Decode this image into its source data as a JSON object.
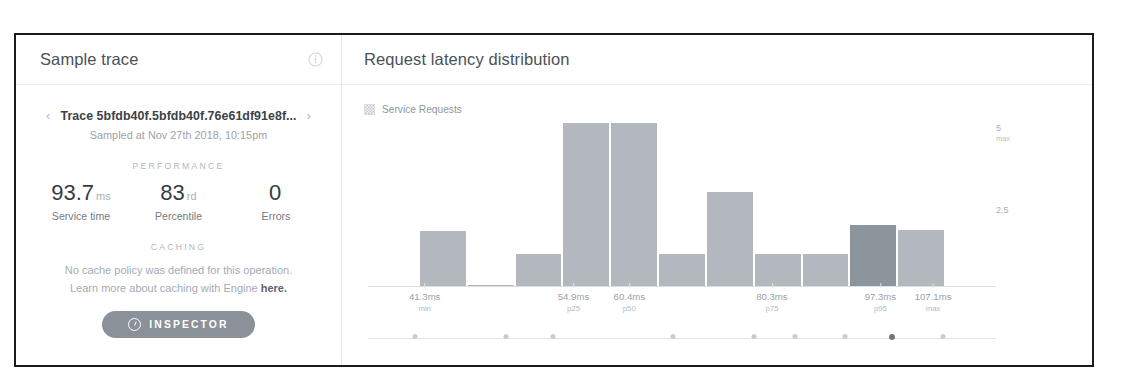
{
  "left_panel": {
    "title": "Sample trace",
    "info_icon": "info-circle-icon",
    "prev_icon": "chevron-left-icon",
    "next_icon": "chevron-right-icon",
    "trace_id": "Trace 5bfdb40f.5bfdb40f.76e61df91e8f...",
    "sampled_at": "Sampled at Nov 27th 2018, 10:15pm",
    "performance_heading": "PERFORMANCE",
    "metrics": [
      {
        "value": "93.7",
        "unit": "ms",
        "label": "Service time"
      },
      {
        "value": "83",
        "unit": "rd",
        "label": "Percentile"
      },
      {
        "value": "0",
        "unit": "",
        "label": "Errors"
      }
    ],
    "caching_heading": "CACHING",
    "caching_line1": "No cache policy was defined for this operation.",
    "caching_line2_prefix": "Learn more about caching with Engine ",
    "caching_link": "here.",
    "inspector_button": "INSPECTOR",
    "inspector_icon": "inspector-circle-icon"
  },
  "right_panel": {
    "title": "Request latency distribution",
    "legend": [
      {
        "label": "Service Requests",
        "swatch": "hatched-gray"
      }
    ]
  },
  "chart_data": {
    "type": "bar",
    "title": "Request latency distribution",
    "xlabel": "",
    "ylabel": "",
    "grid": false,
    "legend_position": "top-left",
    "series": [
      {
        "name": "Service Requests",
        "values": [
          0,
          1.7,
          0.06,
          1.0,
          5.0,
          5.0,
          1.0,
          2.9,
          1.0,
          1.0,
          1.9,
          1.75,
          0
        ]
      }
    ],
    "highlighted_bar_index": 10,
    "ylim": [
      0,
      5
    ],
    "yticks": [
      {
        "value": 5,
        "label": "5",
        "sublabel": "max"
      },
      {
        "value": 2.5,
        "label": "2.5",
        "sublabel": ""
      }
    ],
    "xticks": [
      {
        "position_pct": 8.5,
        "value": "41.3ms",
        "percentile": "min"
      },
      {
        "position_pct": 32.5,
        "value": "54.9ms",
        "percentile": "p25"
      },
      {
        "position_pct": 41.5,
        "value": "60.4ms",
        "percentile": "p50"
      },
      {
        "position_pct": 64.5,
        "value": "80.3ms",
        "percentile": "p75"
      },
      {
        "position_pct": 82.0,
        "value": "97.3ms",
        "percentile": "p95"
      },
      {
        "position_pct": 90.5,
        "value": "107.1ms",
        "percentile": "max"
      }
    ],
    "timeline_dots": [
      {
        "position_pct": 7.5,
        "active": false
      },
      {
        "position_pct": 22.0,
        "active": false
      },
      {
        "position_pct": 29.5,
        "active": false
      },
      {
        "position_pct": 48.5,
        "active": false
      },
      {
        "position_pct": 61.5,
        "active": false
      },
      {
        "position_pct": 68.0,
        "active": false
      },
      {
        "position_pct": 76.0,
        "active": false
      },
      {
        "position_pct": 83.5,
        "active": true
      },
      {
        "position_pct": 91.5,
        "active": false
      }
    ]
  }
}
